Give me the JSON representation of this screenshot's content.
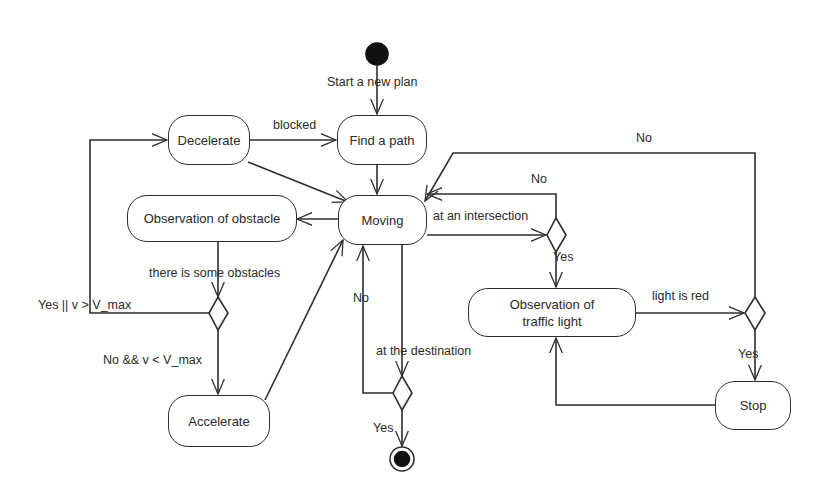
{
  "diagram": {
    "type": "UML activity diagram",
    "nodes": {
      "start": {
        "kind": "initial"
      },
      "find_path": {
        "label": "Find a path"
      },
      "decelerate": {
        "label": "Decelerate"
      },
      "moving": {
        "label": "Moving"
      },
      "obs_obstacle": {
        "label": "Observation of obstacle"
      },
      "accelerate": {
        "label": "Accelerate"
      },
      "obs_light": {
        "label": "Observation of traffic light"
      },
      "stop": {
        "label": "Stop"
      },
      "end": {
        "kind": "final"
      }
    },
    "edge_labels": {
      "start_plan": "Start a new plan",
      "blocked": "blocked",
      "obstacles": "there is some obstacles",
      "yes_vmax": "Yes || v > V_max",
      "no_vmax": "No && v < V_max",
      "no_dest": "No",
      "at_destination": "at the destination",
      "yes_dest": "Yes",
      "at_intersection": "at an intersection",
      "no_intersection": "No",
      "yes_intersection": "Yes",
      "light_red": "light is red",
      "no_light": "No",
      "yes_light": "Yes"
    }
  }
}
